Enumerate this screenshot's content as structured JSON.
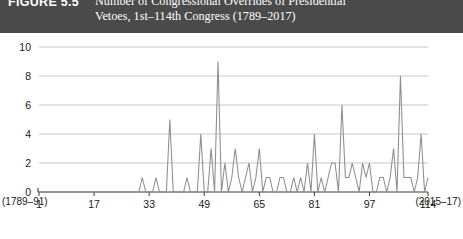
{
  "figure": {
    "label": "FIGURE 5.5",
    "title_line1": "Number of Congressional Overrides of Presidential",
    "title_line2": "Vetoes, 1st–114th Congress (1789–2017)",
    "band_color": "#4a4a4a",
    "line_color": "#8d8d8d",
    "grid_color": "#b9b9b9"
  },
  "axes": {
    "y_ticks": [
      "0",
      "2",
      "4",
      "6",
      "8",
      "10"
    ],
    "x_ticks": [
      "1",
      "17",
      "33",
      "49",
      "65",
      "81",
      "97",
      "114"
    ],
    "x_sub_left": "(1789–91)",
    "x_sub_right": "(2015–17)"
  },
  "chart_data": {
    "type": "line",
    "title": "Number of Congressional Overrides of Presidential Vetoes, 1st–114th Congress (1789–2017)",
    "xlabel": "Congress",
    "ylabel": "Number of overrides",
    "xlim": [
      1,
      114
    ],
    "ylim": [
      0,
      10
    ],
    "grid": true,
    "legend": "none",
    "xtick_values": [
      1,
      17,
      33,
      49,
      65,
      81,
      97,
      114
    ],
    "ytick_values": [
      0,
      2,
      4,
      6,
      8,
      10
    ],
    "x": [
      1,
      2,
      3,
      4,
      5,
      6,
      7,
      8,
      9,
      10,
      11,
      12,
      13,
      14,
      15,
      16,
      17,
      18,
      19,
      20,
      21,
      22,
      23,
      24,
      25,
      26,
      27,
      28,
      29,
      30,
      31,
      32,
      33,
      34,
      35,
      36,
      37,
      38,
      39,
      40,
      41,
      42,
      43,
      44,
      45,
      46,
      47,
      48,
      49,
      50,
      51,
      52,
      53,
      54,
      55,
      56,
      57,
      58,
      59,
      60,
      61,
      62,
      63,
      64,
      65,
      66,
      67,
      68,
      69,
      70,
      71,
      72,
      73,
      74,
      75,
      76,
      77,
      78,
      79,
      80,
      81,
      82,
      83,
      84,
      85,
      86,
      87,
      88,
      89,
      90,
      91,
      92,
      93,
      94,
      95,
      96,
      97,
      98,
      99,
      100,
      101,
      102,
      103,
      104,
      105,
      106,
      107,
      108,
      109,
      110,
      111,
      112,
      113,
      114
    ],
    "values": [
      0,
      0,
      0,
      0,
      0,
      0,
      0,
      0,
      0,
      0,
      0,
      0,
      0,
      0,
      0,
      0,
      0,
      0,
      0,
      0,
      0,
      0,
      0,
      0,
      0,
      0,
      0,
      0,
      0,
      0,
      1,
      0,
      0,
      0,
      1,
      0,
      0,
      0,
      5,
      0,
      0,
      0,
      0,
      1,
      0,
      0,
      0,
      4,
      0,
      0,
      3,
      0,
      9,
      0,
      2,
      0,
      1,
      3,
      1,
      0,
      1,
      2,
      0,
      1,
      3,
      0,
      1,
      1,
      0,
      0,
      1,
      1,
      0,
      0,
      1,
      0,
      1,
      0,
      2,
      0,
      4,
      0,
      1,
      0,
      1,
      2,
      2,
      0,
      6,
      1,
      1,
      2,
      1,
      0,
      2,
      1,
      2,
      0,
      0,
      1,
      1,
      0,
      1,
      3,
      0,
      8,
      1,
      1,
      1,
      0,
      1,
      4,
      0,
      1
    ]
  }
}
